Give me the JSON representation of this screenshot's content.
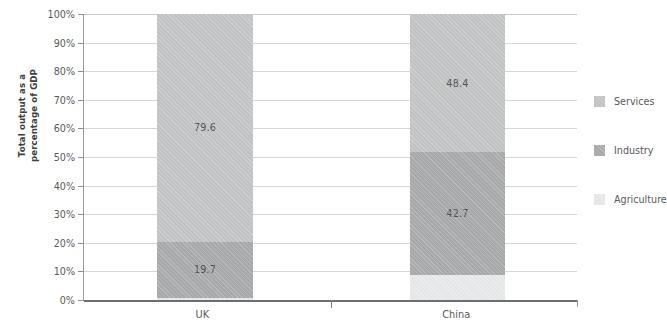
{
  "chart_data": {
    "type": "bar",
    "stacked": true,
    "orientation": "vertical",
    "title": "",
    "xlabel": "",
    "ylabel": "Total output as a percentage of GDP",
    "ylabel_lines": [
      "Total output as a",
      "percentage of GDP"
    ],
    "categories": [
      "UK",
      "China"
    ],
    "ylim": [
      0,
      100
    ],
    "ytick_values": [
      0,
      10,
      20,
      30,
      40,
      50,
      60,
      70,
      80,
      90,
      100
    ],
    "ytick_labels": [
      "0%",
      "10%",
      "20%",
      "30%",
      "40%",
      "50%",
      "60%",
      "70%",
      "80%",
      "90%",
      "100%"
    ],
    "grid": true,
    "legend_position": "right",
    "series": [
      {
        "name": "Agriculture",
        "color": "#e8e9ea",
        "values": [
          0.7,
          8.9
        ],
        "labels": [
          "",
          ""
        ]
      },
      {
        "name": "Industry",
        "color": "#a9aaac",
        "values": [
          19.7,
          42.7
        ],
        "labels": [
          "19.7",
          "42.7"
        ]
      },
      {
        "name": "Services",
        "color": "#c3c4c5",
        "values": [
          79.6,
          48.4
        ],
        "labels": [
          "79.6",
          "48.4"
        ]
      }
    ]
  },
  "axis": {
    "y_title_line1": "Total output as a",
    "y_title_line2": "percentage of GDP",
    "ticks": [
      {
        "label": "100%",
        "value": 100
      },
      {
        "label": "90%",
        "value": 90
      },
      {
        "label": "80%",
        "value": 80
      },
      {
        "label": "70%",
        "value": 70
      },
      {
        "label": "60%",
        "value": 60
      },
      {
        "label": "50%",
        "value": 50
      },
      {
        "label": "40%",
        "value": 40
      },
      {
        "label": "30%",
        "value": 30
      },
      {
        "label": "20%",
        "value": 20
      },
      {
        "label": "10%",
        "value": 10
      },
      {
        "label": "0%",
        "value": 0
      }
    ],
    "categories": [
      {
        "label": "UK",
        "center_pct": 24.0
      },
      {
        "label": "China",
        "center_pct": 75.5
      }
    ]
  },
  "bars": [
    {
      "category": "UK",
      "left_pct": 14.8,
      "width_pct": 19.5,
      "segments": [
        {
          "series": "Services",
          "value": 79.6,
          "label": "79.6",
          "color": "#c3c4c5",
          "start": 20.4,
          "end": 100.0
        },
        {
          "series": "Industry",
          "value": 19.7,
          "label": "19.7",
          "color": "#a9aaac",
          "start": 0.7,
          "end": 20.4
        },
        {
          "series": "Agriculture",
          "value": 0.7,
          "label": "",
          "color": "#e8e9ea",
          "start": 0.0,
          "end": 0.7
        }
      ]
    },
    {
      "category": "China",
      "left_pct": 66.1,
      "width_pct": 19.3,
      "segments": [
        {
          "series": "Services",
          "value": 48.4,
          "label": "48.4",
          "color": "#c3c4c5",
          "start": 51.6,
          "end": 100.0
        },
        {
          "series": "Industry",
          "value": 42.7,
          "label": "42.7",
          "color": "#a9aaac",
          "start": 8.9,
          "end": 51.6
        },
        {
          "series": "Agriculture",
          "value": 8.9,
          "label": "",
          "color": "#e8e9ea",
          "start": 0.0,
          "end": 8.9
        }
      ]
    }
  ],
  "legend": {
    "items": [
      {
        "label": "Services",
        "color": "#c3c4c5",
        "top": 0
      },
      {
        "label": "Industry",
        "color": "#a9aaac",
        "top": 49
      },
      {
        "label": "Agriculture",
        "color": "#e8e9ea",
        "top": 98
      }
    ]
  }
}
